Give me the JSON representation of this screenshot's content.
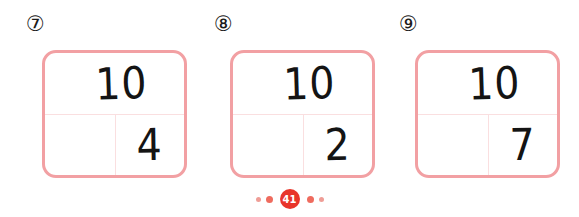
{
  "worksheet": {
    "background_color": "#ffffff",
    "box_border_color": "#f2a0a3",
    "box_divider_color": "#fadfe0",
    "digit_color": "#141414",
    "problems": [
      {
        "label": "⑦",
        "whole": "10",
        "part_left": "",
        "part_right": "4"
      },
      {
        "label": "⑧",
        "whole": "10",
        "part_left": "",
        "part_right": "2"
      },
      {
        "label": "⑨",
        "whole": "10",
        "part_left": "",
        "part_right": "7"
      }
    ]
  },
  "footer": {
    "page_number": "41",
    "badge_color": "#e8352a",
    "dot_color_small": "#ef9d96",
    "dot_color_medium": "#ef6b5e",
    "dots_left": [
      "sm",
      "md"
    ],
    "dots_right": [
      "md",
      "sm"
    ]
  }
}
